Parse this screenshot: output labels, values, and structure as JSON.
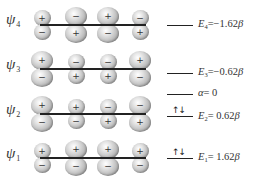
{
  "orbitals": [
    {
      "name": "ψ",
      "sub": "4",
      "line_y": 25,
      "lobes": [
        {
          "x": 42,
          "size": "small",
          "top": "+",
          "bottom": "−"
        },
        {
          "x": 76,
          "size": "large",
          "top": "−",
          "bottom": "+"
        },
        {
          "x": 108,
          "size": "large",
          "top": "+",
          "bottom": "−"
        },
        {
          "x": 140,
          "size": "small",
          "top": "−",
          "bottom": "+"
        }
      ]
    },
    {
      "name": "ψ",
      "sub": "3",
      "line_y": 69,
      "lobes": [
        {
          "x": 42,
          "size": "large",
          "top": "+",
          "bottom": "−"
        },
        {
          "x": 76,
          "size": "small",
          "top": "−",
          "bottom": "+"
        },
        {
          "x": 108,
          "size": "small",
          "top": "−",
          "bottom": "+"
        },
        {
          "x": 140,
          "size": "large",
          "top": "+",
          "bottom": "−"
        }
      ]
    },
    {
      "name": "ψ",
      "sub": "2",
      "line_y": 114,
      "lobes": [
        {
          "x": 42,
          "size": "large",
          "top": "+",
          "bottom": "−"
        },
        {
          "x": 76,
          "size": "small",
          "top": "+",
          "bottom": "−"
        },
        {
          "x": 108,
          "size": "small",
          "top": "−",
          "bottom": "+"
        },
        {
          "x": 140,
          "size": "large",
          "top": "−",
          "bottom": "+"
        }
      ]
    },
    {
      "name": "ψ",
      "sub": "1",
      "line_y": 158,
      "lobes": [
        {
          "x": 42,
          "size": "small",
          "top": "+",
          "bottom": "−"
        },
        {
          "x": 76,
          "size": "large",
          "top": "+",
          "bottom": "−"
        },
        {
          "x": 108,
          "size": "large",
          "top": "+",
          "bottom": "−"
        },
        {
          "x": 140,
          "size": "small",
          "top": "+",
          "bottom": "−"
        }
      ]
    }
  ],
  "energy_levels": [
    {
      "id": "E4",
      "symbol": "E",
      "sub": "4",
      "value": "=−1.62",
      "unit": "β",
      "y": 25,
      "electrons": ""
    },
    {
      "id": "E3",
      "symbol": "E",
      "sub": "3",
      "value": "=−0.62",
      "unit": "β",
      "y": 73,
      "electrons": ""
    },
    {
      "id": "alpha",
      "symbol": "α",
      "sub": "",
      "value": "= 0",
      "unit": "",
      "y": 94,
      "electrons": ""
    },
    {
      "id": "E2",
      "symbol": "E",
      "sub": "2",
      "value": "= 0.62",
      "unit": "β",
      "y": 116,
      "electrons": "↑↓"
    },
    {
      "id": "E1",
      "symbol": "E",
      "sub": "1",
      "value": "= 1.62",
      "unit": "β",
      "y": 158,
      "electrons": "↑↓"
    }
  ],
  "labels": {
    "psi4": "ψ",
    "psi4_sub": "4",
    "psi3": "ψ",
    "psi3_sub": "3",
    "psi2": "ψ",
    "psi2_sub": "2",
    "psi1": "ψ",
    "psi1_sub": "1",
    "e4_sym": "E",
    "e4_sub": "4",
    "e4_val": "=−1.62",
    "e4_unit": "β",
    "e3_sym": "E",
    "e3_sub": "3",
    "e3_val": "=−0.62",
    "e3_unit": "β",
    "alpha_sym": "α",
    "alpha_val": "= 0",
    "e2_sym": "E",
    "e2_sub": "2",
    "e2_val": "= 0.62",
    "e2_unit": "β",
    "e1_sym": "E",
    "e1_sub": "1",
    "e1_val": "= 1.62",
    "e1_unit": "β",
    "e2_electrons": "↑↓",
    "e1_electrons": "↑↓"
  }
}
